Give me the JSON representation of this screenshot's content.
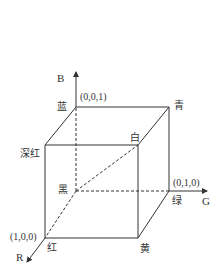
{
  "diagram": {
    "type": "RGB color cube",
    "axes": {
      "b": "B",
      "g": "G",
      "r": "R"
    },
    "coordinates": {
      "blue": "(0,0,1)",
      "green": "(0,1,0)",
      "red": "(1,0,0)"
    },
    "vertices": {
      "blue": "蓝",
      "cyan": "青",
      "white": "白",
      "magenta": "深红",
      "black": "黑",
      "green": "绿",
      "red": "红",
      "yellow": "黄"
    },
    "colors": {
      "line": "#333333",
      "background": "#ffffff"
    }
  }
}
